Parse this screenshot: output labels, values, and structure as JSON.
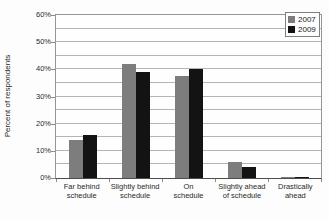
{
  "chart_data": {
    "type": "bar",
    "title": "",
    "xlabel": "",
    "ylabel": "Percent of respondents",
    "ylim": [
      0,
      60
    ],
    "y_tick_step": 10,
    "gridline_step": 5,
    "y_tick_suffix": "%",
    "grid": true,
    "legend_position": "top-right",
    "categories": [
      "Far behind schedule",
      "Slightly behind schedule",
      "On schedule",
      "Slightly ahead of schedule",
      "Drastically ahead"
    ],
    "category_label_lines": [
      [
        "Far behind",
        "schedule"
      ],
      [
        "Slightly behind",
        "schedule"
      ],
      [
        "On",
        "schedule"
      ],
      [
        "Slightly ahead",
        "of schedule"
      ],
      [
        "Drastically",
        "ahead"
      ]
    ],
    "series": [
      {
        "name": "2007",
        "color": "#7d7d7d",
        "values": [
          14,
          42,
          37.5,
          6,
          0.5
        ]
      },
      {
        "name": "2009",
        "color": "#131313",
        "values": [
          16,
          39,
          40,
          4,
          0.5
        ]
      }
    ]
  },
  "colors": {
    "background": "#fdfdfd",
    "plot_background": "#fefefe",
    "gridline": "#b4b4b4",
    "plot_border": "#969696",
    "axis_line": "#4d4d4d",
    "text": "#2a2a2a"
  }
}
